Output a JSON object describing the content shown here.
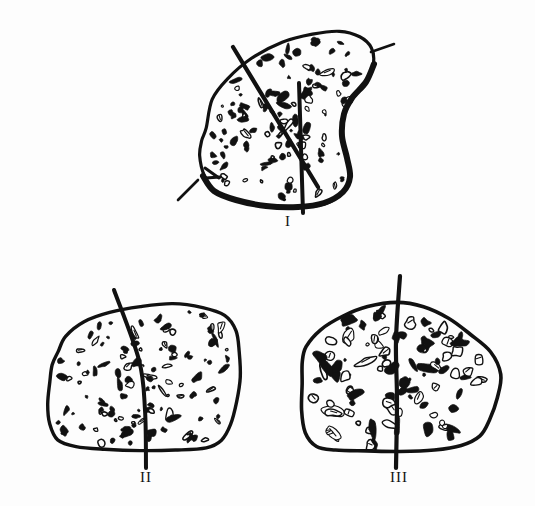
{
  "figure": {
    "kind": "hand-drawn specimen cross-sections",
    "background_color": "#fdfdfd",
    "ink_color": "#111111",
    "width": 535,
    "height": 506,
    "specimens": [
      {
        "id": "I",
        "label": "I",
        "label_text": "I",
        "shape": "elongated oval / leaf outline, tilted, thick lower-right edge",
        "outline_stroke_width": 3.2,
        "heavy_edge_stroke_width": 6,
        "center": [
          300,
          120
        ],
        "outline_points": [
          [
            206,
            128
          ],
          [
            212,
            100
          ],
          [
            228,
            78
          ],
          [
            252,
            58
          ],
          [
            282,
            43
          ],
          [
            312,
            34
          ],
          [
            340,
            32
          ],
          [
            360,
            36
          ],
          [
            372,
            48
          ],
          [
            374,
            64
          ],
          [
            366,
            82
          ],
          [
            352,
            98
          ],
          [
            344,
            114
          ],
          [
            342,
            134
          ],
          [
            346,
            156
          ],
          [
            350,
            176
          ],
          [
            344,
            192
          ],
          [
            326,
            203
          ],
          [
            300,
            207
          ],
          [
            268,
            206
          ],
          [
            238,
            201
          ],
          [
            216,
            192
          ],
          [
            204,
            176
          ],
          [
            200,
            156
          ],
          [
            202,
            140
          ]
        ],
        "heavy_edge_points": [
          [
            374,
            64
          ],
          [
            366,
            82
          ],
          [
            352,
            98
          ],
          [
            344,
            114
          ],
          [
            342,
            136
          ],
          [
            347,
            158
          ],
          [
            350,
            177
          ],
          [
            343,
            192
          ],
          [
            324,
            203
          ],
          [
            298,
            207
          ],
          [
            266,
            206
          ],
          [
            236,
            200
          ],
          [
            214,
            191
          ],
          [
            203,
            176
          ]
        ],
        "lines": [
          {
            "name": "diagonal-section-line",
            "kind": "solid",
            "from": [
              233,
              47
            ],
            "to": [
              318,
              187
            ],
            "stroke_width": 4.2
          },
          {
            "name": "diagonal-dash-upper-right",
            "kind": "dashed-segment",
            "from": [
              371,
              52
            ],
            "to": [
              394,
              44
            ],
            "stroke_width": 2.6
          },
          {
            "name": "diagonal-dash-lower-left",
            "kind": "dashed-segment",
            "from": [
              178,
              200
            ],
            "to": [
              198,
              180
            ],
            "stroke_width": 2.6
          },
          {
            "name": "vertical-section-line",
            "kind": "solid",
            "from": [
              299,
              83
            ],
            "to": [
              303,
              213
            ],
            "stroke_width": 4.0
          }
        ],
        "speckle_count": 120,
        "speckle_size": "small-to-medium",
        "notch_marks": [
          {
            "name": "left-notch",
            "from": [
              205,
              168
            ],
            "to": [
              219,
              178
            ]
          },
          {
            "name": "left-notch-2",
            "from": [
              206,
              178
            ],
            "to": [
              220,
              177
            ]
          }
        ]
      },
      {
        "id": "II",
        "label": "II",
        "label_text": "II",
        "shape": "rounded blob / soft rectangle",
        "outline_stroke_width": 3.4,
        "center": [
          150,
          375
        ],
        "outline_points": [
          [
            58,
            352
          ],
          [
            66,
            336
          ],
          [
            84,
            322
          ],
          [
            110,
            312
          ],
          [
            140,
            306
          ],
          [
            172,
            304
          ],
          [
            202,
            307
          ],
          [
            224,
            315
          ],
          [
            236,
            330
          ],
          [
            240,
            352
          ],
          [
            240,
            378
          ],
          [
            236,
            402
          ],
          [
            230,
            424
          ],
          [
            222,
            440
          ],
          [
            206,
            448
          ],
          [
            176,
            450
          ],
          [
            140,
            450
          ],
          [
            104,
            449
          ],
          [
            76,
            447
          ],
          [
            58,
            440
          ],
          [
            50,
            424
          ],
          [
            48,
            404
          ],
          [
            50,
            382
          ],
          [
            52,
            364
          ]
        ],
        "lines": [
          {
            "name": "section-line",
            "kind": "polyline",
            "points": [
              [
                114,
                290
              ],
              [
                139,
                360
              ],
              [
                145,
                410
              ],
              [
                146,
                468
              ]
            ],
            "stroke_width": 4.0
          }
        ],
        "speckle_count": 125,
        "speckle_size": "small-to-medium"
      },
      {
        "id": "III",
        "label": "III",
        "label_text": "III",
        "shape": "broad dome / pentagon outline",
        "outline_stroke_width": 3.6,
        "center": [
          400,
          378
        ],
        "outline_points": [
          [
            306,
            346
          ],
          [
            320,
            330
          ],
          [
            342,
            316
          ],
          [
            368,
            306
          ],
          [
            396,
            302
          ],
          [
            424,
            306
          ],
          [
            448,
            318
          ],
          [
            470,
            334
          ],
          [
            490,
            352
          ],
          [
            500,
            374
          ],
          [
            498,
            398
          ],
          [
            490,
            420
          ],
          [
            480,
            436
          ],
          [
            462,
            446
          ],
          [
            434,
            450
          ],
          [
            400,
            451
          ],
          [
            366,
            451
          ],
          [
            336,
            450
          ],
          [
            316,
            446
          ],
          [
            306,
            432
          ],
          [
            302,
            410
          ],
          [
            302,
            384
          ],
          [
            303,
            362
          ]
        ],
        "lines": [
          {
            "name": "section-line",
            "kind": "polyline",
            "points": [
              [
                400,
                276
              ],
              [
                396,
                340
              ],
              [
                397,
                400
              ],
              [
                396,
                468
              ]
            ],
            "stroke_width": 4.2
          }
        ],
        "speckle_count": 105,
        "speckle_size": "medium-to-large"
      }
    ]
  }
}
